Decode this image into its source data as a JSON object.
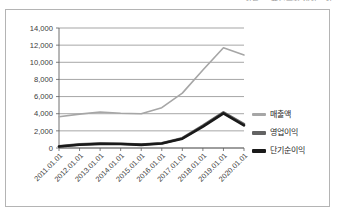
{
  "top_caption": "자료: 금융감독원 전자공시",
  "chart_data": {
    "type": "line",
    "title": "",
    "xlabel": "",
    "ylabel": "",
    "ylim": [
      0,
      14000
    ],
    "ytick_step": 2000,
    "ytick_labels": [
      "0",
      "2,000",
      "4,000",
      "6,000",
      "8,000",
      "10,000",
      "12,000",
      "14,000"
    ],
    "ytick_values": [
      0,
      2000,
      4000,
      6000,
      8000,
      10000,
      12000,
      14000
    ],
    "grid": true,
    "legend_position": "right",
    "categories": [
      "2011.01.01",
      "2012.01.01",
      "2013.01.01",
      "2014.01.01",
      "2015.01.01",
      "2016.01.01",
      "2017.01.01",
      "2018.01.01",
      "2019.01.01",
      "2020.01.01"
    ],
    "series": [
      {
        "name": "매출액",
        "color": "#a6a6a6",
        "values": [
          3650,
          3950,
          4200,
          4050,
          4000,
          4700,
          6400,
          9100,
          11700,
          10850
        ]
      },
      {
        "name": "영업이익",
        "color": "#636363",
        "values": [
          200,
          420,
          520,
          500,
          400,
          560,
          1150,
          2600,
          4150,
          2780
        ]
      },
      {
        "name": "단기순이익",
        "color": "#1a1a1a",
        "values": [
          180,
          380,
          480,
          460,
          370,
          520,
          1080,
          2500,
          4050,
          2650
        ]
      }
    ]
  },
  "legend": {
    "items": [
      {
        "label": "매출액",
        "color": "#a6a6a6"
      },
      {
        "label": "영업이익",
        "color": "#636363"
      },
      {
        "label": "단기순이익",
        "color": "#1a1a1a"
      }
    ]
  }
}
